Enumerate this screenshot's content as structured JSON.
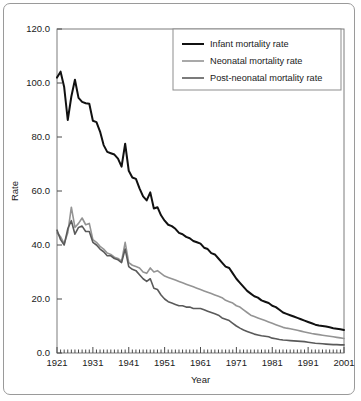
{
  "chart_data": {
    "type": "line",
    "title": "",
    "xlabel": "Year",
    "ylabel": "Rate",
    "xlim": [
      1921,
      2001
    ],
    "ylim": [
      0.0,
      120.0
    ],
    "grid": false,
    "legend_position": "top-right",
    "y_ticks": [
      "0.0",
      "20.0",
      "40.0",
      "60.0",
      "80.0",
      "100.0",
      "120.0"
    ],
    "y_tick_values": [
      0,
      20,
      40,
      60,
      80,
      100,
      120
    ],
    "x_ticks": [
      "1921",
      "1931",
      "1941",
      "1951",
      "1961",
      "1971",
      "1981",
      "1991",
      "2001"
    ],
    "x_tick_values": [
      1921,
      1931,
      1941,
      1951,
      1961,
      1971,
      1981,
      1991,
      2001
    ],
    "x_minor_tick_step": 1,
    "x": [
      1921,
      1922,
      1923,
      1924,
      1925,
      1926,
      1927,
      1928,
      1929,
      1930,
      1931,
      1932,
      1933,
      1934,
      1935,
      1936,
      1937,
      1938,
      1939,
      1940,
      1941,
      1942,
      1943,
      1944,
      1945,
      1946,
      1947,
      1948,
      1949,
      1950,
      1951,
      1952,
      1953,
      1954,
      1955,
      1956,
      1957,
      1958,
      1959,
      1960,
      1961,
      1962,
      1963,
      1964,
      1965,
      1966,
      1967,
      1968,
      1969,
      1970,
      1971,
      1972,
      1973,
      1974,
      1975,
      1976,
      1977,
      1978,
      1979,
      1980,
      1981,
      1982,
      1983,
      1984,
      1985,
      1986,
      1987,
      1988,
      1989,
      1990,
      1991,
      1992,
      1993,
      1994,
      1995,
      1996,
      1997,
      1998,
      1999,
      2000,
      2001
    ],
    "series": [
      {
        "name": "Infant mortality rate",
        "color": "#111111",
        "width": 2.0,
        "values": [
          102.0,
          104.2,
          98.5,
          86.3,
          95.0,
          101.2,
          94.5,
          93.0,
          92.5,
          92.3,
          86.0,
          85.5,
          82.0,
          77.0,
          74.5,
          74.0,
          73.5,
          72.0,
          69.0,
          77.5,
          67.5,
          65.0,
          64.5,
          61.0,
          58.0,
          56.5,
          59.5,
          53.5,
          54.0,
          51.0,
          49.0,
          47.5,
          47.0,
          46.0,
          44.5,
          44.0,
          43.0,
          42.5,
          41.5,
          41.0,
          40.5,
          39.0,
          38.5,
          37.0,
          36.5,
          35.0,
          33.5,
          32.0,
          31.5,
          29.5,
          27.5,
          26.0,
          24.5,
          23.0,
          22.0,
          21.0,
          20.5,
          19.5,
          19.0,
          18.5,
          17.5,
          17.0,
          16.0,
          15.0,
          14.5,
          14.0,
          13.5,
          13.0,
          12.5,
          12.0,
          11.5,
          11.0,
          10.5,
          10.2,
          10.0,
          9.8,
          9.5,
          9.2,
          9.0,
          8.8,
          8.5
        ]
      },
      {
        "name": "Neonatal mortality rate",
        "color": "#949494",
        "width": 1.6,
        "values": [
          44.5,
          43.0,
          40.5,
          44.5,
          54.0,
          46.5,
          48.0,
          50.0,
          47.5,
          48.0,
          42.0,
          41.0,
          39.5,
          38.5,
          37.0,
          36.5,
          35.5,
          35.0,
          34.0,
          41.0,
          33.5,
          32.5,
          32.0,
          31.5,
          30.0,
          29.5,
          31.5,
          30.0,
          30.5,
          29.5,
          28.5,
          28.0,
          27.5,
          27.0,
          26.5,
          26.0,
          25.5,
          25.0,
          24.5,
          24.0,
          23.5,
          23.0,
          22.5,
          22.0,
          21.5,
          21.0,
          20.5,
          19.5,
          19.0,
          18.5,
          17.5,
          17.0,
          16.0,
          15.0,
          14.0,
          13.5,
          13.0,
          12.5,
          12.0,
          11.5,
          11.0,
          10.5,
          10.0,
          9.5,
          9.2,
          9.0,
          8.7,
          8.4,
          8.1,
          7.8,
          7.5,
          7.2,
          7.0,
          6.8,
          6.6,
          6.4,
          6.2,
          6.0,
          5.8,
          5.6,
          5.4
        ]
      },
      {
        "name": "Post-neonatal mortality rate",
        "color": "#5a5a5a",
        "width": 1.6,
        "values": [
          45.5,
          42.0,
          40.0,
          46.0,
          49.0,
          44.0,
          46.5,
          47.0,
          45.0,
          45.0,
          41.0,
          40.0,
          38.5,
          37.5,
          36.0,
          36.0,
          35.0,
          34.5,
          33.5,
          38.5,
          32.0,
          31.0,
          30.5,
          29.0,
          27.5,
          26.5,
          27.5,
          24.0,
          23.5,
          21.5,
          20.0,
          19.0,
          18.5,
          18.0,
          17.5,
          17.5,
          17.0,
          17.0,
          16.5,
          16.5,
          16.5,
          16.0,
          15.5,
          15.0,
          14.5,
          14.0,
          13.0,
          12.5,
          12.0,
          11.0,
          10.0,
          9.2,
          8.5,
          8.0,
          7.5,
          7.0,
          6.7,
          6.4,
          6.2,
          6.0,
          5.5,
          5.3,
          5.0,
          4.8,
          4.7,
          4.6,
          4.5,
          4.4,
          4.3,
          4.2,
          4.0,
          3.8,
          3.6,
          3.5,
          3.4,
          3.3,
          3.2,
          3.1,
          3.1,
          3.0,
          3.0
        ]
      }
    ]
  },
  "legend": {
    "items": [
      {
        "label": "Infant mortality rate"
      },
      {
        "label": "Neonatal mortality rate"
      },
      {
        "label": "Post-neonatal mortality rate"
      }
    ]
  }
}
